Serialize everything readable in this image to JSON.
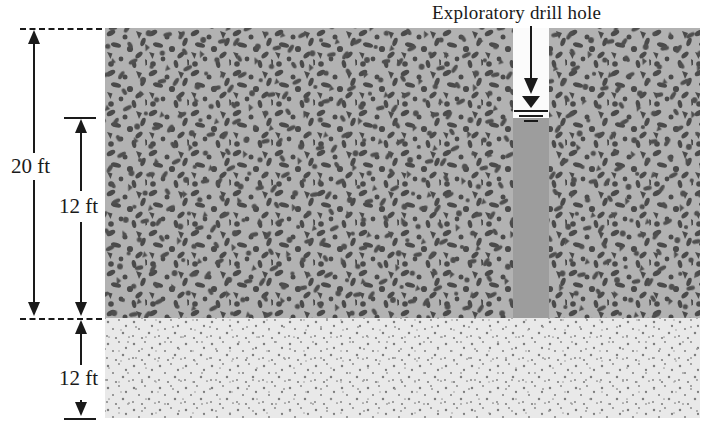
{
  "figure": {
    "type": "soil-profile-cross-section",
    "callout_label": "Exploratory drill hole"
  },
  "dimensions": [
    {
      "id": "total-depth",
      "label": "20 ft",
      "value": 20,
      "unit": "ft",
      "from": "ground-surface",
      "to": "layer-boundary"
    },
    {
      "id": "upper-layer",
      "label": "12 ft",
      "value": 12,
      "unit": "ft",
      "from": "water-table",
      "to": "layer-boundary"
    },
    {
      "id": "lower-layer",
      "label": "12 ft",
      "value": 12,
      "unit": "ft",
      "from": "layer-boundary",
      "to": "bottom-of-profile"
    }
  ],
  "layers": [
    {
      "id": "upper",
      "texture": "gravelly-clay-stipple",
      "fill": "#b2b2b2",
      "particle_color": "#4a4a4a"
    },
    {
      "id": "lower",
      "texture": "sand-dot-stipple",
      "fill": "#e9e9e9",
      "particle_color": "#8a8a8a"
    }
  ],
  "drill_hole": {
    "air_fill": "#fbfbfb",
    "water_fill": "#9d9d9d",
    "water_table_symbol": "inverted-triangle-with-three-lines"
  },
  "icons": {
    "leader_arrow": "arrow-down-icon",
    "water_table": "water-table-icon"
  }
}
